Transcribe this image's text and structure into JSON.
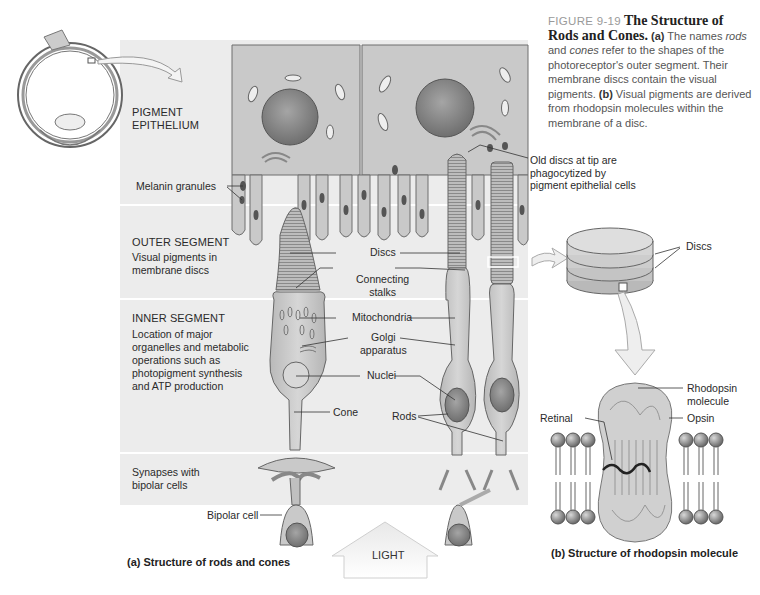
{
  "caption": {
    "figure_number": "FIGURE 9-19",
    "title": "The Structure of Rods and Cones.",
    "part_a_marker": "(a)",
    "part_a_text_1": " The names ",
    "part_a_em_1": "rods",
    "part_a_text_2": " and ",
    "part_a_em_2": "cones",
    "part_a_text_3": " refer to the shapes of the photoreceptor's outer segment. Their membrane discs contain the visual pigments. ",
    "part_b_marker": "(b)",
    "part_b_text": " Visual pigments are derived from rhodopsin molecules within the membrane of a disc."
  },
  "regions": {
    "pigment_epithelium": {
      "title_line1": "PIGMENT",
      "title_line2": "EPITHELIUM"
    },
    "outer_segment": {
      "title": "OUTER SEGMENT",
      "desc": "Visual pigments in membrane discs"
    },
    "inner_segment": {
      "title": "INNER SEGMENT",
      "desc": "Location of major organelles and metabolic operations such as photopigment synthesis and ATP production"
    },
    "synapses": {
      "desc": "Synapses with bipolar cells"
    }
  },
  "labels": {
    "melanin_granules": "Melanin granules",
    "old_discs_line1": "Old discs at tip are",
    "old_discs_line2": "phagocytized by",
    "old_discs_line3": "pigment epithelial cells",
    "discs": "Discs",
    "connecting_line1": "Connecting",
    "connecting_line2": "stalks",
    "mitochondria": "Mitochondria",
    "golgi_line1": "Golgi",
    "golgi_line2": "apparatus",
    "nuclei": "Nuclei",
    "cone": "Cone",
    "rods": "Rods",
    "bipolar_cell": "Bipolar cell",
    "light": "LIGHT",
    "discs_b": "Discs",
    "rhodopsin_line1": "Rhodopsin",
    "rhodopsin_line2": "molecule",
    "opsin": "Opsin",
    "retinal": "Retinal"
  },
  "subcaptions": {
    "a": "(a) Structure of rods and cones",
    "b": "(b) Structure of rhodopsin molecule"
  },
  "colors": {
    "panel_bg": "#ececec",
    "cell_fill": "#c9c9c9",
    "cell_stroke": "#6e6e6e",
    "nucleus": "#8a8a8a",
    "granule": "#555555",
    "text": "#2a2a2a",
    "caption_grey": "#9a9a9a"
  }
}
